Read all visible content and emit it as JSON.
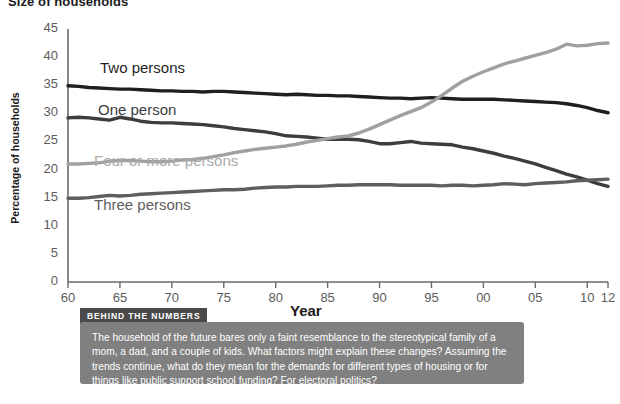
{
  "page_title": "Size of households",
  "chart_data": {
    "type": "line",
    "title": "Size of households",
    "xlabel": "Year",
    "ylabel": "Percentage of households",
    "xlim": [
      1960,
      2012
    ],
    "ylim": [
      0,
      45
    ],
    "ytick_values": [
      0,
      5,
      10,
      15,
      20,
      25,
      30,
      35,
      40,
      45
    ],
    "ytick_labels": [
      "0",
      "5",
      "10",
      "15",
      "20",
      "25",
      "30",
      "35",
      "40",
      "45"
    ],
    "xtick_values": [
      1960,
      1965,
      1970,
      1975,
      1980,
      1985,
      1990,
      1995,
      2000,
      2005,
      2010,
      2012
    ],
    "xtick_labels": [
      "60",
      "65",
      "70",
      "75",
      "80",
      "85",
      "90",
      "95",
      "00",
      "05",
      "10",
      "12"
    ],
    "grid": false,
    "legend_position": "inline-labels",
    "series": [
      {
        "name": "Two persons",
        "color": "#1f1f1f",
        "x": [
          1960,
          1961,
          1962,
          1963,
          1964,
          1965,
          1966,
          1967,
          1968,
          1969,
          1970,
          1971,
          1972,
          1973,
          1974,
          1975,
          1976,
          1977,
          1978,
          1979,
          1980,
          1981,
          1982,
          1983,
          1984,
          1985,
          1986,
          1987,
          1988,
          1989,
          1990,
          1991,
          1992,
          1993,
          1994,
          1995,
          1996,
          1997,
          1998,
          1999,
          2000,
          2001,
          2002,
          2003,
          2004,
          2005,
          2006,
          2007,
          2008,
          2009,
          2010,
          2011,
          2012
        ],
        "values": [
          34.9,
          34.8,
          34.6,
          34.5,
          34.4,
          34.3,
          34.3,
          34.2,
          34.1,
          34.0,
          34.0,
          33.9,
          33.9,
          33.8,
          33.9,
          33.9,
          33.8,
          33.7,
          33.6,
          33.5,
          33.4,
          33.3,
          33.4,
          33.3,
          33.2,
          33.2,
          33.1,
          33.1,
          33.0,
          32.9,
          32.8,
          32.7,
          32.7,
          32.6,
          32.7,
          32.8,
          32.7,
          32.6,
          32.5,
          32.5,
          32.5,
          32.5,
          32.4,
          32.3,
          32.2,
          32.1,
          32.0,
          31.9,
          31.7,
          31.4,
          31.0,
          30.5,
          30.1
        ]
      },
      {
        "name": "One person",
        "color": "#3d3d3d",
        "x": [
          1960,
          1961,
          1962,
          1963,
          1964,
          1965,
          1966,
          1967,
          1968,
          1969,
          1970,
          1971,
          1972,
          1973,
          1974,
          1975,
          1976,
          1977,
          1978,
          1979,
          1980,
          1981,
          1982,
          1983,
          1984,
          1985,
          1986,
          1987,
          1988,
          1989,
          1990,
          1991,
          1992,
          1993,
          1994,
          1995,
          1996,
          1997,
          1998,
          1999,
          2000,
          2001,
          2002,
          2003,
          2004,
          2005,
          2006,
          2007,
          2008,
          2009,
          2010,
          2011,
          2012
        ],
        "values": [
          29.2,
          29.3,
          29.2,
          29.0,
          28.8,
          29.3,
          29.0,
          28.6,
          28.4,
          28.3,
          28.3,
          28.2,
          28.1,
          28.0,
          27.8,
          27.6,
          27.3,
          27.1,
          26.9,
          26.7,
          26.4,
          26.0,
          25.9,
          25.8,
          25.6,
          25.4,
          25.4,
          25.4,
          25.3,
          25.0,
          24.6,
          24.6,
          24.8,
          25.0,
          24.7,
          24.6,
          24.5,
          24.4,
          24.0,
          23.7,
          23.3,
          22.9,
          22.4,
          22.0,
          21.5,
          21.0,
          20.4,
          19.8,
          19.2,
          18.7,
          18.1,
          17.5,
          17.0
        ]
      },
      {
        "name": "Four or more persons",
        "color": "#a0a0a0",
        "x": [
          1960,
          1961,
          1962,
          1963,
          1964,
          1965,
          1966,
          1967,
          1968,
          1969,
          1970,
          1971,
          1972,
          1973,
          1974,
          1975,
          1976,
          1977,
          1978,
          1979,
          1980,
          1981,
          1982,
          1983,
          1984,
          1985,
          1986,
          1987,
          1988,
          1989,
          1990,
          1991,
          1992,
          1993,
          1994,
          1995,
          1996,
          1997,
          1998,
          1999,
          2000,
          2001,
          2002,
          2003,
          2004,
          2005,
          2006,
          2007,
          2008,
          2009,
          2010,
          2011,
          2012
        ],
        "values": [
          21.0,
          21.0,
          21.1,
          21.2,
          21.5,
          21.6,
          21.6,
          21.5,
          21.4,
          21.4,
          21.5,
          21.7,
          21.8,
          22.0,
          22.3,
          22.6,
          23.0,
          23.3,
          23.6,
          23.8,
          24.0,
          24.2,
          24.5,
          24.9,
          25.2,
          25.5,
          25.8,
          26.0,
          26.5,
          27.2,
          28.0,
          28.8,
          29.6,
          30.3,
          31.0,
          32.0,
          33.2,
          34.5,
          35.7,
          36.6,
          37.4,
          38.1,
          38.8,
          39.3,
          39.8,
          40.3,
          40.8,
          41.4,
          42.3,
          42.0,
          42.1,
          42.4,
          42.5
        ]
      },
      {
        "name": "Three persons",
        "color": "#5e5e5e",
        "x": [
          1960,
          1961,
          1962,
          1963,
          1964,
          1965,
          1966,
          1967,
          1968,
          1969,
          1970,
          1971,
          1972,
          1973,
          1974,
          1975,
          1976,
          1977,
          1978,
          1979,
          1980,
          1981,
          1982,
          1983,
          1984,
          1985,
          1986,
          1987,
          1988,
          1989,
          1990,
          1991,
          1992,
          1993,
          1994,
          1995,
          1996,
          1997,
          1998,
          1999,
          2000,
          2001,
          2002,
          2003,
          2004,
          2005,
          2006,
          2007,
          2008,
          2009,
          2010,
          2011,
          2012
        ],
        "values": [
          14.9,
          14.9,
          15.0,
          15.2,
          15.4,
          15.3,
          15.4,
          15.6,
          15.7,
          15.8,
          15.9,
          16.0,
          16.1,
          16.2,
          16.3,
          16.4,
          16.4,
          16.5,
          16.7,
          16.8,
          16.9,
          16.9,
          17.0,
          17.0,
          17.0,
          17.1,
          17.2,
          17.2,
          17.3,
          17.3,
          17.3,
          17.3,
          17.2,
          17.2,
          17.2,
          17.2,
          17.1,
          17.2,
          17.2,
          17.1,
          17.2,
          17.3,
          17.5,
          17.4,
          17.3,
          17.5,
          17.6,
          17.7,
          17.8,
          18.0,
          18.1,
          18.2,
          18.3
        ]
      }
    ],
    "series_labels": [
      {
        "text": "Two persons",
        "color": "#1f1f1f"
      },
      {
        "text": "One person",
        "color": "#3d3d3d"
      },
      {
        "text": "Four or more persons",
        "color": "#a9a9a9"
      },
      {
        "text": "Three persons",
        "color": "#5e5e5e"
      }
    ]
  },
  "callout": {
    "badge": "BEHIND THE NUMBERS",
    "text": "The household of the future bares only a faint resemblance to the stereotypical family of a mom, a dad, and a couple of kids. What factors might explain these changes? Assuming the trends continue, what do they mean for the demands for different types of housing or for things like public support school funding? For electoral politics?"
  }
}
